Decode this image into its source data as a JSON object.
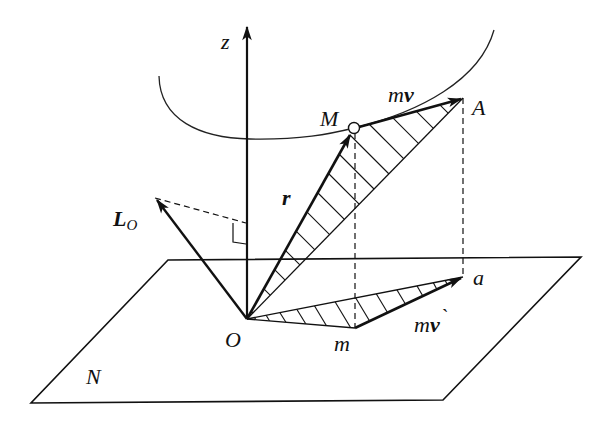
{
  "diagram": {
    "colors": {
      "stroke": "#111111",
      "background": "#ffffff"
    },
    "labels": {
      "z_axis": "z",
      "point_M": "M",
      "momentum": "mv",
      "momentum_m": "m",
      "momentum_v": "v",
      "point_A": "A",
      "position_vector": "r",
      "angular_momentum": "L",
      "angular_momentum_sub": "O",
      "origin": "O",
      "point_a": "a",
      "projected_momentum_m": "m",
      "projected_momentum_v": "v",
      "projected_momentum_prime": "`",
      "point_m": "m",
      "plane": "N"
    },
    "points": {
      "O": [
        247,
        319
      ],
      "M": [
        354,
        128
      ],
      "A": [
        463,
        98
      ],
      "m": [
        355,
        328
      ],
      "a": [
        463,
        277
      ],
      "z_tip": [
        247,
        25
      ],
      "L_tip": [
        155,
        198
      ],
      "plane": [
        [
          168,
          260
        ],
        [
          581,
          257
        ],
        [
          443,
          400
        ],
        [
          31,
          403
        ]
      ]
    }
  }
}
